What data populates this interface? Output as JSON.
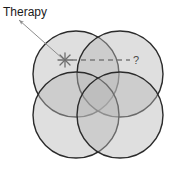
{
  "figure": {
    "type": "four-set-venn-diagram",
    "background_color": "#ffffff",
    "annotations": {
      "therapy_label": "Therapy",
      "unknown_marker": "?",
      "star_marker": "asterisk-star"
    },
    "circles": [
      {
        "id": "top-left",
        "cx": 76,
        "cy": 74,
        "r": 43,
        "fill": "#b8b8b8",
        "stroke": "#2b2b2b",
        "opacity": 0.45
      },
      {
        "id": "top-right",
        "cx": 120,
        "cy": 74,
        "r": 43,
        "fill": "#b8b8b8",
        "stroke": "#2b2b2b",
        "opacity": 0.45
      },
      {
        "id": "bottom-left",
        "cx": 76,
        "cy": 115,
        "r": 43,
        "fill": "#b8b8b8",
        "stroke": "#2b2b2b",
        "opacity": 0.45
      },
      {
        "id": "bottom-right",
        "cx": 120,
        "cy": 115,
        "r": 43,
        "fill": "#b8b8b8",
        "stroke": "#2b2b2b",
        "opacity": 0.45
      }
    ],
    "pointer": {
      "from_x": 19,
      "from_y": 20,
      "to_x": 63,
      "to_y": 59,
      "stroke": "#8d8d8d",
      "arrowhead_at": "start"
    },
    "dashed_path": {
      "from_x": 72,
      "from_y": 60,
      "to_x": 130,
      "to_y": 60,
      "stroke": "#7a7a7a",
      "dash": "5 4"
    },
    "star": {
      "cx": 65,
      "cy": 60,
      "r": 7,
      "stroke": "#6e6e6e"
    },
    "qmark": {
      "x": 133,
      "y": 64
    },
    "label_pos": {
      "x": 3,
      "y": 16
    }
  },
  "colors": {
    "circle_fill": "#b8b8b8",
    "circle_stroke": "#2b2b2b",
    "text": "#1a1a1a",
    "annotation_gray": "#8d8d8d"
  }
}
